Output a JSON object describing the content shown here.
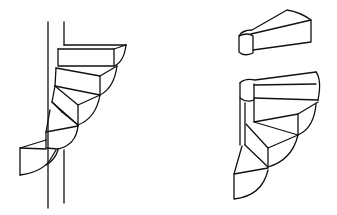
{
  "figure": {
    "panels": [
      {
        "id": "left",
        "subject": "spiral stair wound around a central pole"
      },
      {
        "id": "right",
        "subject": "single wedge step element above an assembled spiral stair"
      }
    ],
    "colors": {
      "line": "#111111",
      "background": "#ffffff"
    }
  }
}
